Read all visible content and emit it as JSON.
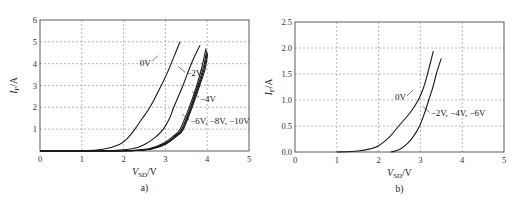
{
  "chart_data": [
    {
      "type": "line",
      "panel_label": "a)",
      "xlabel": "V_SD/V",
      "xlabel_main": "V",
      "xlabel_sub": "SD",
      "xlabel_unit": "/V",
      "ylabel": "I_F/A",
      "ylabel_main": "I",
      "ylabel_sub": "F",
      "ylabel_unit": "/A",
      "xlim": [
        0,
        5
      ],
      "ylim": [
        0,
        6
      ],
      "xticks": [
        "0",
        "1",
        "2",
        "3",
        "4",
        "5"
      ],
      "yticks": [
        "1",
        "2",
        "3",
        "4",
        "5",
        "6"
      ],
      "ytick_values": [
        1,
        2,
        3,
        4,
        5,
        6
      ],
      "grid": true,
      "series": [
        {
          "name": "0V",
          "x": [
            0,
            1.0,
            1.5,
            1.9,
            2.1,
            2.27,
            2.45,
            2.63,
            2.85,
            3.05,
            3.2,
            3.35
          ],
          "y": [
            0,
            0.01,
            0.08,
            0.3,
            0.6,
            1.0,
            1.5,
            2.0,
            2.8,
            3.6,
            4.3,
            5.0
          ]
        },
        {
          "name": "-2V",
          "x": [
            0,
            1.5,
            2.2,
            2.55,
            2.8,
            2.95,
            3.1,
            3.2,
            3.42,
            3.62,
            3.83
          ],
          "y": [
            0,
            0.01,
            0.1,
            0.35,
            0.7,
            1.0,
            1.5,
            2.0,
            3.0,
            4.0,
            4.85
          ]
        },
        {
          "name": "-4V",
          "x": [
            0,
            2.0,
            2.6,
            2.95,
            3.2,
            3.35,
            3.57,
            3.75,
            3.88,
            3.97
          ],
          "y": [
            0,
            0.01,
            0.1,
            0.35,
            0.7,
            1.0,
            2.0,
            3.0,
            3.9,
            4.7
          ]
        },
        {
          "name": "-6V",
          "x": [
            0,
            2.05,
            2.65,
            3.0,
            3.24,
            3.39,
            3.6,
            3.78,
            3.91,
            3.99
          ],
          "y": [
            0,
            0.01,
            0.1,
            0.35,
            0.7,
            1.0,
            2.0,
            3.0,
            3.85,
            4.6
          ]
        },
        {
          "name": "-8V",
          "x": [
            0,
            2.1,
            2.68,
            3.02,
            3.26,
            3.41,
            3.62,
            3.8,
            3.93,
            4.0
          ],
          "y": [
            0,
            0.01,
            0.1,
            0.35,
            0.7,
            1.0,
            2.0,
            3.0,
            3.8,
            4.5
          ]
        },
        {
          "name": "-10V",
          "x": [
            0,
            2.12,
            2.7,
            3.04,
            3.28,
            3.43,
            3.64,
            3.82,
            3.95,
            4.01
          ],
          "y": [
            0,
            0.01,
            0.1,
            0.35,
            0.7,
            1.0,
            2.0,
            3.0,
            3.75,
            4.45
          ]
        }
      ],
      "annotations": [
        {
          "text": "0V",
          "points_to": "0V",
          "at": [
            2.7,
            4.0
          ]
        },
        {
          "text": "−2V",
          "points_to": "-2V",
          "at": [
            3.45,
            3.6
          ]
        },
        {
          "text": "−4V",
          "points_to": "-4V",
          "at": [
            3.73,
            2.45
          ]
        },
        {
          "text": "−6V, −8V, −10V",
          "points_to": "-6V,-8V,-10V",
          "at": [
            3.5,
            1.5
          ]
        }
      ]
    },
    {
      "type": "line",
      "panel_label": "b)",
      "xlabel": "V_SD/V",
      "xlabel_main": "V",
      "xlabel_sub": "SD",
      "xlabel_unit": "/V",
      "ylabel": "I_F/A",
      "ylabel_main": "I",
      "ylabel_sub": "F",
      "ylabel_unit": "/A",
      "xlim": [
        0,
        5
      ],
      "ylim": [
        0,
        2.5
      ],
      "xticks": [
        "0",
        "1",
        "2",
        "3",
        "4",
        "5"
      ],
      "yticks": [
        "0.0",
        "0.5",
        "1.0",
        "1.5",
        "2.0",
        "2.5"
      ],
      "ytick_values": [
        0,
        0.5,
        1.0,
        1.5,
        2.0,
        2.5
      ],
      "grid": true,
      "series": [
        {
          "name": "0V",
          "x": [
            1.0,
            1.5,
            1.8,
            2.0,
            2.25,
            2.48,
            2.75,
            2.95,
            3.08,
            3.17,
            3.25,
            3.31
          ],
          "y": [
            0,
            0.02,
            0.06,
            0.12,
            0.28,
            0.5,
            0.75,
            1.0,
            1.25,
            1.5,
            1.75,
            1.94
          ]
        },
        {
          "name": "-2V, -4V, -6V",
          "x": [
            2.3,
            2.5,
            2.7,
            2.85,
            2.98,
            3.1,
            3.2,
            3.3,
            3.38,
            3.45,
            3.5
          ],
          "y": [
            0,
            0.05,
            0.17,
            0.32,
            0.5,
            0.75,
            1.0,
            1.25,
            1.5,
            1.68,
            1.8
          ]
        }
      ],
      "annotations": [
        {
          "text": "0V",
          "points_to": "0V",
          "at": [
            2.75,
            1.0
          ]
        },
        {
          "text": "−2V, −4V, −6V",
          "points_to": "-2V, -4V, -6V",
          "at": [
            3.15,
            0.8
          ]
        }
      ]
    }
  ]
}
